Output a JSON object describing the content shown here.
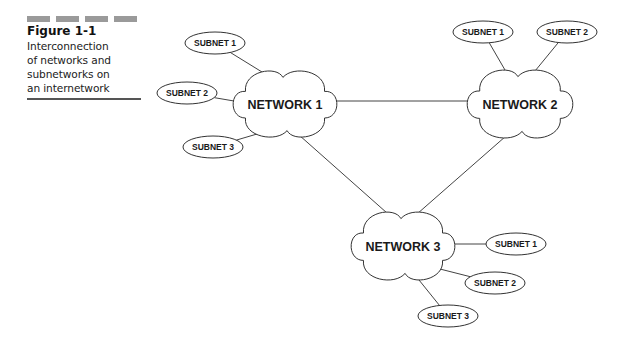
{
  "caption": {
    "figure_label": "Figure 1-1",
    "description_lines": [
      "Interconnection",
      "of networks and",
      "subnetworks on",
      "an internetwork"
    ]
  },
  "diagram": {
    "networks": [
      {
        "id": "net1",
        "label": "NETWORK 1"
      },
      {
        "id": "net2",
        "label": "NETWORK 2"
      },
      {
        "id": "net3",
        "label": "NETWORK 3"
      }
    ],
    "subnets": [
      {
        "id": "n1s1",
        "network": "net1",
        "label": "SUBNET 1"
      },
      {
        "id": "n1s2",
        "network": "net1",
        "label": "SUBNET 2"
      },
      {
        "id": "n1s3",
        "network": "net1",
        "label": "SUBNET 3"
      },
      {
        "id": "n2s1",
        "network": "net2",
        "label": "SUBNET 1"
      },
      {
        "id": "n2s2",
        "network": "net2",
        "label": "SUBNET 2"
      },
      {
        "id": "n3s1",
        "network": "net3",
        "label": "SUBNET 1"
      },
      {
        "id": "n3s2",
        "network": "net3",
        "label": "SUBNET 2"
      },
      {
        "id": "n3s3",
        "network": "net3",
        "label": "SUBNET 3"
      }
    ],
    "network_links": [
      {
        "from": "net1",
        "to": "net2"
      },
      {
        "from": "net1",
        "to": "net3"
      },
      {
        "from": "net2",
        "to": "net3"
      }
    ]
  }
}
